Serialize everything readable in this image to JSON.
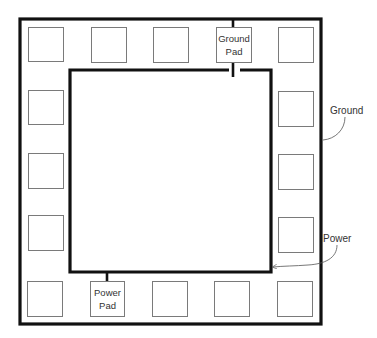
{
  "diagram": {
    "colors": {
      "ring": "#111111",
      "pad_stroke": "#7a7a7a",
      "text": "#333333",
      "callout": "#555555"
    },
    "outer_ring": {
      "x": 20,
      "y": 19,
      "w": 301,
      "h": 305,
      "label": "Ground"
    },
    "inner_ring": {
      "x": 70,
      "y": 70,
      "w": 201,
      "h": 202,
      "label": "Power"
    },
    "pads": [
      {
        "x": 28,
        "y": 27
      },
      {
        "x": 91,
        "y": 27
      },
      {
        "x": 153,
        "y": 27
      },
      {
        "x": 216,
        "y": 27,
        "label_line1": "Ground",
        "label_line2": "Pad"
      },
      {
        "x": 278,
        "y": 27
      },
      {
        "x": 28,
        "y": 90
      },
      {
        "x": 278,
        "y": 91
      },
      {
        "x": 28,
        "y": 153
      },
      {
        "x": 278,
        "y": 154
      },
      {
        "x": 28,
        "y": 215
      },
      {
        "x": 278,
        "y": 217
      },
      {
        "x": 27,
        "y": 281
      },
      {
        "x": 90,
        "y": 281,
        "label_line1": "Power",
        "label_line2": "Pad"
      },
      {
        "x": 152,
        "y": 281
      },
      {
        "x": 214,
        "y": 281
      },
      {
        "x": 277,
        "y": 281
      }
    ],
    "labels": {
      "ground_pad_line1": "Ground",
      "ground_pad_line2": "Pad",
      "power_pad_line1": "Power",
      "power_pad_line2": "Pad",
      "ground_callout": "Ground",
      "power_callout": "Power"
    }
  }
}
